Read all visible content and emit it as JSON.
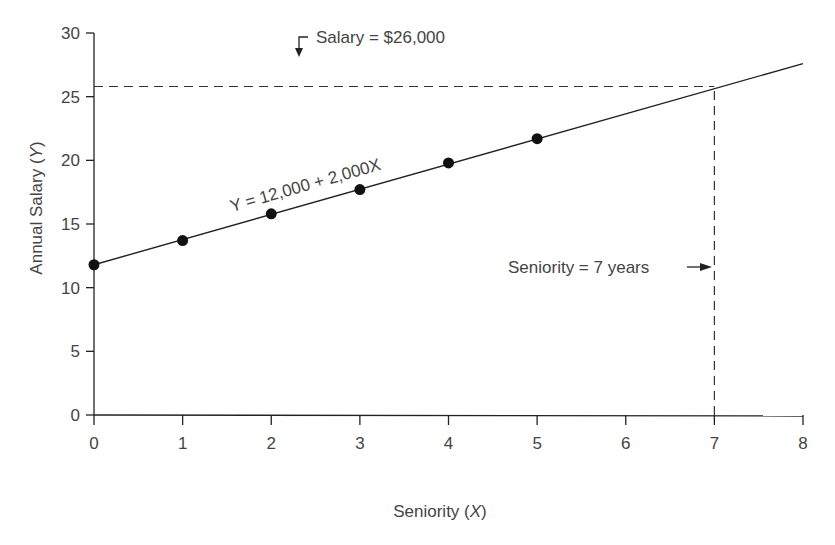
{
  "chart_data": {
    "type": "scatter",
    "title": "",
    "xlabel": "Seniority (X)",
    "xlabel_main": "Seniority ",
    "xlabel_var": "X",
    "ylabel": "Annual Salary (Y)",
    "ylabel_main": "Annual Salary ",
    "ylabel_var": "Y",
    "xlim": [
      0,
      8
    ],
    "ylim": [
      0,
      30
    ],
    "x_ticks": [
      "0",
      "1",
      "2",
      "3",
      "4",
      "5",
      "6",
      "7",
      "8"
    ],
    "y_ticks": [
      "0",
      "5",
      "10",
      "15",
      "20",
      "25",
      "30"
    ],
    "grid": false,
    "legend": null,
    "series": [
      {
        "name": "observations",
        "type": "scatter",
        "x": [
          0,
          1,
          2,
          3,
          4,
          5
        ],
        "y": [
          11.8,
          13.7,
          15.8,
          17.7,
          19.8,
          21.7
        ]
      },
      {
        "name": "regression line",
        "type": "line",
        "x": [
          0,
          8
        ],
        "y": [
          11.8,
          27.6
        ]
      }
    ],
    "annotations": [
      {
        "text": "Y = 12,000 + 2,000X",
        "position": "along regression line between x=1.5 and x=3.8"
      },
      {
        "text": "Salary = $26,000",
        "arrow": "down to dashed line at y≈25.8"
      },
      {
        "text": "Seniority = 7 years",
        "arrow": "right to dashed line at x=7"
      }
    ],
    "reference_lines": [
      {
        "orientation": "horizontal",
        "y": 25.8,
        "from_x": 0,
        "to_x": 7,
        "style": "dashed"
      },
      {
        "orientation": "vertical",
        "x": 7,
        "from_y": 0,
        "to_y": 25.8,
        "style": "dashed"
      }
    ]
  },
  "annotations": {
    "equation": "Y = 12,000 + 2,000X",
    "salary": "Salary = $26,000",
    "seniority": "Seniority = 7 years"
  },
  "colors": {
    "ink": "#222222",
    "text": "#444444",
    "background": "#ffffff"
  }
}
